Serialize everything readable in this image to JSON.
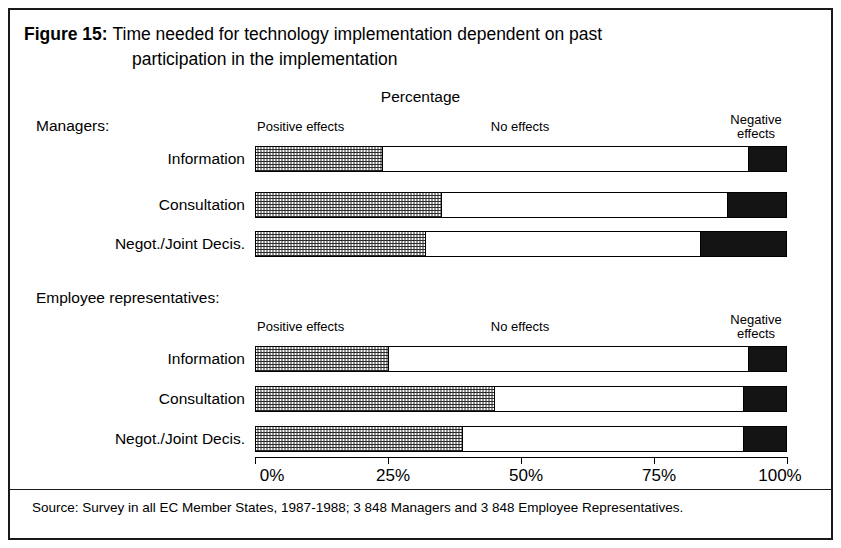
{
  "figure": {
    "label": "Figure 15:",
    "title_line_1": "Time needed for technology implementation dependent on past",
    "title_line_2": "participation in the implementation",
    "axis_caption": "Percentage",
    "source": "Source: Survey in all EC Member States, 1987-1988; 3 848 Managers and 3 848 Employee Representatives."
  },
  "groups": [
    {
      "heading": "Managers:",
      "legend": {
        "positive": "Positive effects",
        "none": "No effects",
        "negative_line1": "Negative",
        "negative_line2": "effects"
      }
    },
    {
      "heading": "Employee representatives:",
      "legend": {
        "positive": "Positive effects",
        "none": "No effects",
        "negative_line1": "Negative",
        "negative_line2": "effects"
      }
    }
  ],
  "axis": {
    "ticks": [
      "0%",
      "25%",
      "50%",
      "75%",
      "100%"
    ],
    "tick_values": [
      0,
      25,
      50,
      75,
      100
    ]
  },
  "chart_data": {
    "type": "bar",
    "orientation": "horizontal",
    "stacked": true,
    "stack_total": 100,
    "title": "Time needed for technology implementation dependent on past participation in the implementation",
    "subtitle": "Percentage",
    "xlabel": "Percentage",
    "ylabel": "",
    "xlim": [
      0,
      100
    ],
    "grid": false,
    "legend_position": "above-bars",
    "series": [
      {
        "name": "Positive effects",
        "fill": "checkerboard-hatch"
      },
      {
        "name": "No effects",
        "fill": "white"
      },
      {
        "name": "Negative effects",
        "fill": "black"
      }
    ],
    "groups": [
      {
        "name": "Managers",
        "categories": [
          "Information",
          "Consultation",
          "Negot./Joint Decis."
        ],
        "values": {
          "Positive effects": [
            24,
            35,
            32
          ],
          "No effects": [
            69,
            54,
            52
          ],
          "Negative effects": [
            7,
            11,
            16
          ]
        }
      },
      {
        "name": "Employee representatives",
        "categories": [
          "Information",
          "Consultation",
          "Negot./Joint Decis."
        ],
        "values": {
          "Positive effects": [
            25,
            45,
            39
          ],
          "No effects": [
            68,
            47,
            53
          ],
          "Negative effects": [
            7,
            8,
            8
          ]
        }
      }
    ],
    "source": "Source: Survey in all EC Member States, 1987-1988; 3 848 Managers and 3 848 Employee Representatives."
  },
  "bars": [
    {
      "label": "Information",
      "positive": 24,
      "none": 69,
      "negative": 7
    },
    {
      "label": "Consultation",
      "positive": 35,
      "none": 54,
      "negative": 11
    },
    {
      "label": "Negot./Joint Decis.",
      "positive": 32,
      "none": 52,
      "negative": 16
    },
    {
      "label": "Information",
      "positive": 25,
      "none": 68,
      "negative": 7
    },
    {
      "label": "Consultation",
      "positive": 45,
      "none": 47,
      "negative": 8
    },
    {
      "label": "Negot./Joint Decis.",
      "positive": 39,
      "none": 53,
      "negative": 8
    }
  ]
}
